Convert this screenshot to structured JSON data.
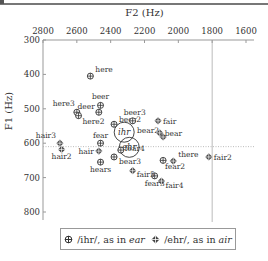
{
  "chart_data": {
    "type": "scatter",
    "title": "",
    "xlabel": "F2 (Hz)",
    "ylabel": "F1 (Hz)",
    "x_axis": {
      "position": "top",
      "reversed": true,
      "range": [
        2800,
        1600
      ],
      "ticks": [
        2800,
        2600,
        2400,
        2200,
        2000,
        1800,
        1600
      ]
    },
    "y_axis": {
      "reversed": true,
      "range": [
        300,
        800
      ],
      "ticks": [
        300,
        400,
        500,
        600,
        700,
        800
      ]
    },
    "reference_lines": {
      "vertical_x": 1800,
      "horizontal_dotted_y": 610
    },
    "ellipses": [
      {
        "label": "ihr",
        "cx": 2320,
        "cy": 568
      },
      {
        "label": "ehr",
        "cx": 2290,
        "cy": 612
      }
    ],
    "series": [
      {
        "name": "/ihr/, as in ear",
        "marker": "circle-plus",
        "points": [
          {
            "label": "here",
            "x": 2520,
            "y": 405
          },
          {
            "label": "here3",
            "x": 2600,
            "y": 510
          },
          {
            "label": "here2",
            "x": 2590,
            "y": 520
          },
          {
            "label": "beer",
            "x": 2460,
            "y": 490
          },
          {
            "label": "deer",
            "x": 2470,
            "y": 510
          },
          {
            "label": "beer2",
            "x": 2380,
            "y": 545
          },
          {
            "label": "beer3",
            "x": 2270,
            "y": 535
          },
          {
            "label": "fear",
            "x": 2460,
            "y": 600
          },
          {
            "label": "fear4",
            "x": 2340,
            "y": 620
          },
          {
            "label": "bear3",
            "x": 2380,
            "y": 640
          },
          {
            "label": "hears",
            "x": 2460,
            "y": 655
          },
          {
            "label": "fear2",
            "x": 2090,
            "y": 650
          },
          {
            "label": "fear3",
            "x": 2140,
            "y": 695
          }
        ]
      },
      {
        "name": "/ehr/, as in air",
        "marker": "diamond-plus",
        "points": [
          {
            "label": "hair3",
            "x": 2700,
            "y": 600
          },
          {
            "label": "hair2",
            "x": 2690,
            "y": 618
          },
          {
            "label": "hair",
            "x": 2470,
            "y": 623
          },
          {
            "label": "bear2",
            "x": 2090,
            "y": 582
          },
          {
            "label": "bear",
            "x": 2110,
            "y": 570
          },
          {
            "label": "fair",
            "x": 2120,
            "y": 535
          },
          {
            "label": "there",
            "x": 2030,
            "y": 652
          },
          {
            "label": "fair5",
            "x": 2270,
            "y": 680
          },
          {
            "label": "fair4",
            "x": 2100,
            "y": 710
          },
          {
            "label": "fair2",
            "x": 1820,
            "y": 640
          }
        ]
      }
    ],
    "legend": {
      "position": "bottom",
      "entries": [
        "/ihr/, as in ear",
        "/ehr/, as in air"
      ]
    }
  },
  "labels": {
    "x_title": "F2 (Hz)",
    "y_title": "F1 (Hz)",
    "legend_ihr_prefix": "/ihr/, as in ",
    "legend_ihr_word": "ear",
    "legend_ehr_prefix": "/ehr/, as in ",
    "legend_ehr_word": "air",
    "ellipse_ihr": "ihr",
    "ellipse_ehr": "ehr"
  }
}
